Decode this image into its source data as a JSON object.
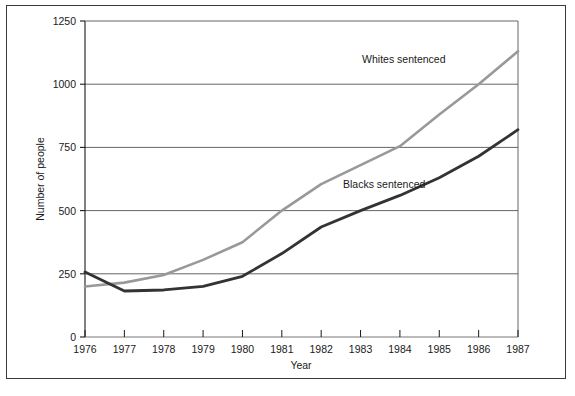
{
  "chart_data": {
    "type": "line",
    "title": "",
    "xlabel": "Year",
    "ylabel": "Number of people",
    "x": [
      1976,
      1977,
      1978,
      1979,
      1980,
      1981,
      1982,
      1983,
      1984,
      1985,
      1986,
      1987
    ],
    "xtick_labels": [
      "1976",
      "1977",
      "1978",
      "1979",
      "1980",
      "1981",
      "1982",
      "1983",
      "1984",
      "1985",
      "1986",
      "1987"
    ],
    "ytick_labels": [
      "0",
      "250",
      "500",
      "750",
      "1000",
      "1250"
    ],
    "yticks": [
      0,
      250,
      500,
      750,
      1000,
      1250
    ],
    "ylim": [
      0,
      1250
    ],
    "xlim": [
      1976,
      1987
    ],
    "grid": "horizontal",
    "legend_position": "inline-annotation",
    "series": [
      {
        "name": "Whites sentenced",
        "label": "Whites sentenced",
        "color": "#999999",
        "values": [
          200,
          215,
          245,
          305,
          375,
          500,
          605,
          680,
          755,
          880,
          1000,
          1130
        ]
      },
      {
        "name": "Blacks sentenced",
        "label": "Blacks sentenced",
        "color": "#333333",
        "values": [
          257,
          182,
          186,
          200,
          240,
          330,
          435,
          500,
          560,
          630,
          715,
          820
        ]
      }
    ],
    "annotations": [
      {
        "text": "Whites sentenced",
        "x": 1984.1,
        "y": 1085
      },
      {
        "text": "Blacks sentenced",
        "x": 1983.6,
        "y": 590
      }
    ]
  },
  "colors": {
    "whites_line": "#999999",
    "blacks_line": "#333333",
    "axis": "#1a1a1a",
    "grid": "#555555",
    "frame": "#3a3a3a",
    "background": "#ffffff"
  }
}
